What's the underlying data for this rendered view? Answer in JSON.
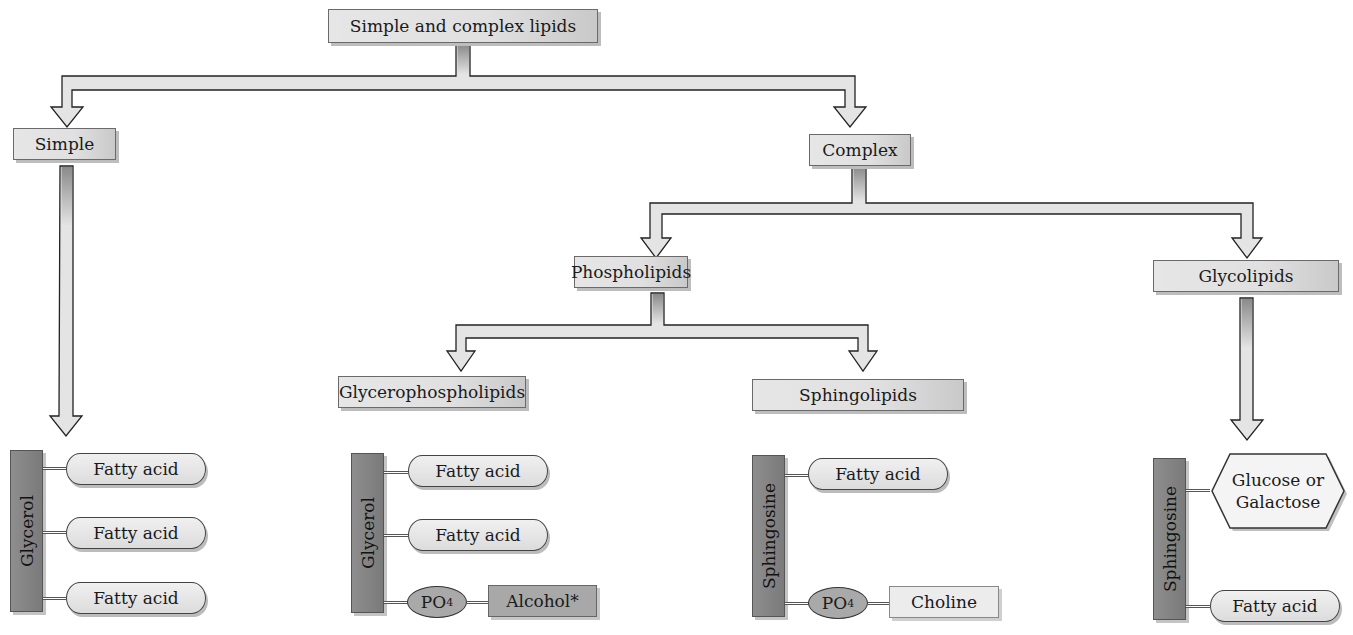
{
  "title": "Simple and complex lipids",
  "level1": {
    "simple": "Simple",
    "complex": "Complex"
  },
  "level2": {
    "phospholipids": "Phospholipids",
    "glycolipids": "Glycolipids"
  },
  "level3": {
    "glycerophospholipids": "Glycerophospholipids",
    "sphingolipids": "Sphingolipids"
  },
  "structures": {
    "simple": {
      "backbone": "Glycerol",
      "components": [
        "Fatty acid",
        "Fatty acid",
        "Fatty acid"
      ]
    },
    "glycerophospholipid": {
      "backbone": "Glycerol",
      "components": [
        "Fatty acid",
        "Fatty acid"
      ],
      "phosphate": "PO",
      "phosphate_sub": "4",
      "head_group": "Alcohol*"
    },
    "sphingolipid": {
      "backbone": "Sphingosine",
      "components": [
        "Fatty acid"
      ],
      "phosphate": "PO",
      "phosphate_sub": "4",
      "head_group": "Choline"
    },
    "glycolipid": {
      "backbone": "Sphingosine",
      "sugar_line1": "Glucose or",
      "sugar_line2": "Galactose",
      "components": [
        "Fatty acid"
      ]
    }
  },
  "colors": {
    "box_fill": "#e2e2e2",
    "backbone_fill": "#7f7f7f",
    "phosphate_fill": "#a9a9a9",
    "alcohol_fill": "#a8a8a8",
    "outline": "#333333"
  }
}
